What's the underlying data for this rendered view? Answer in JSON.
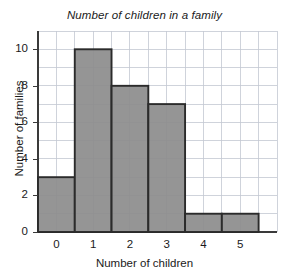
{
  "chart_data": {
    "type": "bar",
    "title": "Number of children in a family",
    "xlabel": "Number of children",
    "ylabel": "Number of families",
    "categories": [
      "0",
      "1",
      "2",
      "3",
      "4",
      "5"
    ],
    "values": [
      3,
      10,
      8,
      7,
      1,
      1
    ],
    "xtick_labels": [
      "0",
      "1",
      "2",
      "3",
      "4",
      "5"
    ],
    "ytick_labels": [
      "0",
      "2",
      "4",
      "6",
      "8",
      "10"
    ],
    "ytick_values": [
      0,
      2,
      4,
      6,
      8,
      10
    ],
    "xlim": [
      -0.5,
      6.0
    ],
    "ylim": [
      0,
      11
    ],
    "grid": true,
    "grid_minor_y_step": 1,
    "grid_minor_x_step": 0.5,
    "legend": null,
    "bar_width": 1,
    "colors": {
      "bar_fill": "#8d8d8d",
      "bar_edge": "#2b2b2b",
      "gridline": "#c3c8d2",
      "axis": "#3a3a3a",
      "text": "#1a1a1a",
      "background": "#ffffff"
    }
  }
}
